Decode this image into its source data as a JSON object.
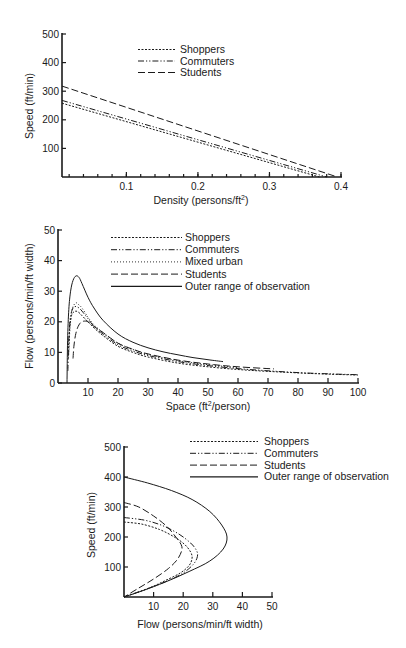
{
  "styles": {
    "Shoppers": {
      "dash": "2,1.5",
      "width": 1
    },
    "Commuters": {
      "dash": "6,2,1.2,2,1.2,2",
      "width": 1
    },
    "Mixed urban": {
      "dash": "1,2",
      "width": 0.9
    },
    "Students": {
      "dash": "7,3",
      "width": 1
    },
    "Outer range of observation": {
      "dash": "",
      "width": 1.3
    }
  },
  "chart_data": [
    {
      "id": "speed-density",
      "type": "line",
      "title": "",
      "xlabel": "Density (persons/ft²)",
      "xlabel_main": "Density (persons/ft",
      "xlabel_sup": "2",
      "xlabel_end": ")",
      "ylabel": "Speed (ft/min)",
      "xlim": [
        0.01,
        0.4
      ],
      "ylim": [
        0,
        500
      ],
      "x_ticks": [
        0.1,
        0.2,
        0.3,
        0.4
      ],
      "x_tick_labels": [
        "0.1",
        "0.2",
        "0.3",
        "0.4"
      ],
      "y_ticks": [
        100,
        200,
        300,
        400,
        500
      ],
      "y_tick_labels": [
        "100",
        "200",
        "300",
        "400",
        "500"
      ],
      "grid": false,
      "legend_position": "upper center",
      "legend": [
        "Shoppers",
        "Commuters",
        "Students"
      ],
      "series": [
        {
          "name": "Shoppers",
          "x": [
            0.01,
            0.37
          ],
          "y": [
            258,
            0
          ]
        },
        {
          "name": "Commuters",
          "x": [
            0.01,
            0.38
          ],
          "y": [
            268,
            0
          ]
        },
        {
          "name": "Students",
          "x": [
            0.01,
            0.395
          ],
          "y": [
            318,
            0
          ]
        }
      ]
    },
    {
      "id": "flow-space",
      "type": "line",
      "title": "",
      "xlabel": "Space (ft²/person)",
      "xlabel_main": "Space (ft",
      "xlabel_sup": "2",
      "xlabel_end": "/person)",
      "ylabel": "Flow (persons/min/ft width)",
      "xlim": [
        0,
        100
      ],
      "ylim": [
        0,
        50
      ],
      "x_ticks": [
        10,
        20,
        30,
        40,
        50,
        60,
        70,
        80,
        90,
        100
      ],
      "x_tick_labels": [
        "10",
        "20",
        "30",
        "40",
        "50",
        "60",
        "70",
        "80",
        "90",
        "100"
      ],
      "y_ticks": [
        0,
        10,
        20,
        30,
        40,
        50
      ],
      "y_tick_labels": [
        "0",
        "10",
        "20",
        "30",
        "40",
        "50"
      ],
      "grid": false,
      "legend_position": "upper right",
      "legend": [
        "Shoppers",
        "Commuters",
        "Mixed urban",
        "Students",
        "Outer range of observation"
      ],
      "series": [
        {
          "name": "Shoppers",
          "x": [
            3.5,
            3.7,
            4,
            4.5,
            5,
            6,
            7,
            8,
            10,
            12,
            15,
            20,
            25,
            30,
            40,
            50,
            60,
            70,
            80,
            90,
            100
          ],
          "y": [
            8,
            14,
            19,
            22,
            23,
            23.5,
            23,
            22,
            20,
            18,
            15.5,
            12,
            10,
            8.5,
            6.5,
            5.3,
            4.4,
            3.8,
            3.3,
            2.9,
            2.6
          ]
        },
        {
          "name": "Commuters",
          "x": [
            3.3,
            3.5,
            3.8,
            4.2,
            5,
            6,
            7,
            8,
            10,
            12,
            15,
            20,
            25,
            30,
            40,
            50,
            60,
            70,
            80,
            90,
            100
          ],
          "y": [
            4,
            12,
            18,
            22,
            24.5,
            25,
            24.5,
            23.5,
            21,
            18.5,
            16,
            12.5,
            10.5,
            9,
            7,
            5.7,
            4.7,
            4,
            3.4,
            3,
            2.7
          ]
        },
        {
          "name": "Mixed urban",
          "x": [
            3.6,
            4,
            4.5,
            5,
            6,
            7,
            8,
            10,
            12,
            15,
            20,
            25,
            30,
            40,
            50,
            60
          ],
          "y": [
            10,
            18,
            23,
            25,
            26.2,
            25.5,
            24.5,
            21.5,
            19,
            16.5,
            13,
            11,
            9.3,
            7.3,
            6,
            5
          ]
        },
        {
          "name": "Students",
          "x": [
            5,
            5.3,
            5.8,
            6.5,
            7.5,
            8.5,
            10,
            12,
            15,
            20,
            25,
            30,
            40,
            50,
            60,
            72
          ],
          "y": [
            8,
            12,
            15.5,
            18,
            19.7,
            20.2,
            20,
            18.5,
            16.5,
            13,
            11,
            9.5,
            7.5,
            6.2,
            5.3,
            4.6
          ]
        },
        {
          "name": "Outer range of observation",
          "x": [
            3,
            3.2,
            3.6,
            4.2,
            5,
            6,
            7,
            8,
            10,
            12,
            15,
            20,
            25,
            30,
            35,
            40,
            45,
            50,
            55
          ],
          "y": [
            0,
            14,
            24,
            30,
            33.5,
            35,
            34.5,
            32.5,
            28,
            24.5,
            20.5,
            16,
            13.3,
            11.5,
            10.2,
            9.2,
            8.3,
            7.6,
            7
          ]
        }
      ]
    },
    {
      "id": "speed-flow",
      "type": "line",
      "title": "",
      "xlabel": "Flow (persons/min/ft width)",
      "ylabel": "Speed (ft/min)",
      "xlim": [
        0,
        50
      ],
      "ylim": [
        0,
        500
      ],
      "x_ticks": [
        10,
        20,
        30,
        40,
        50
      ],
      "x_tick_labels": [
        "10",
        "20",
        "30",
        "40",
        "50"
      ],
      "y_ticks": [
        100,
        200,
        300,
        400,
        500
      ],
      "y_tick_labels": [
        "100",
        "200",
        "300",
        "400",
        "500"
      ],
      "grid": false,
      "legend_position": "upper right",
      "legend": [
        "Shoppers",
        "Commuters",
        "Students",
        "Outer range of observation"
      ],
      "series": [
        {
          "name": "Shoppers",
          "x": [
            0,
            6,
            12,
            17,
            20.5,
            22.5,
            23,
            22,
            19,
            14,
            8,
            0
          ],
          "y": [
            250,
            243,
            225,
            200,
            175,
            150,
            130,
            105,
            80,
            55,
            28,
            0
          ]
        },
        {
          "name": "Commuters",
          "x": [
            0,
            7,
            13,
            18.5,
            22.5,
            24.5,
            24.8,
            23.5,
            20,
            15,
            8,
            0
          ],
          "y": [
            265,
            256,
            238,
            210,
            180,
            155,
            135,
            110,
            80,
            55,
            28,
            0
          ]
        },
        {
          "name": "Students",
          "x": [
            0,
            5,
            10,
            14.5,
            17.5,
            19.3,
            19.5,
            18,
            15,
            10,
            5,
            0
          ],
          "y": [
            315,
            300,
            270,
            235,
            200,
            175,
            155,
            125,
            95,
            60,
            30,
            0
          ]
        },
        {
          "name": "Outer range of observation",
          "x": [
            0,
            8,
            16,
            23,
            29,
            33,
            34.8,
            33.5,
            29,
            22,
            14,
            6,
            0
          ],
          "y": [
            400,
            380,
            355,
            325,
            285,
            240,
            200,
            160,
            120,
            85,
            50,
            20,
            0
          ]
        }
      ]
    }
  ]
}
